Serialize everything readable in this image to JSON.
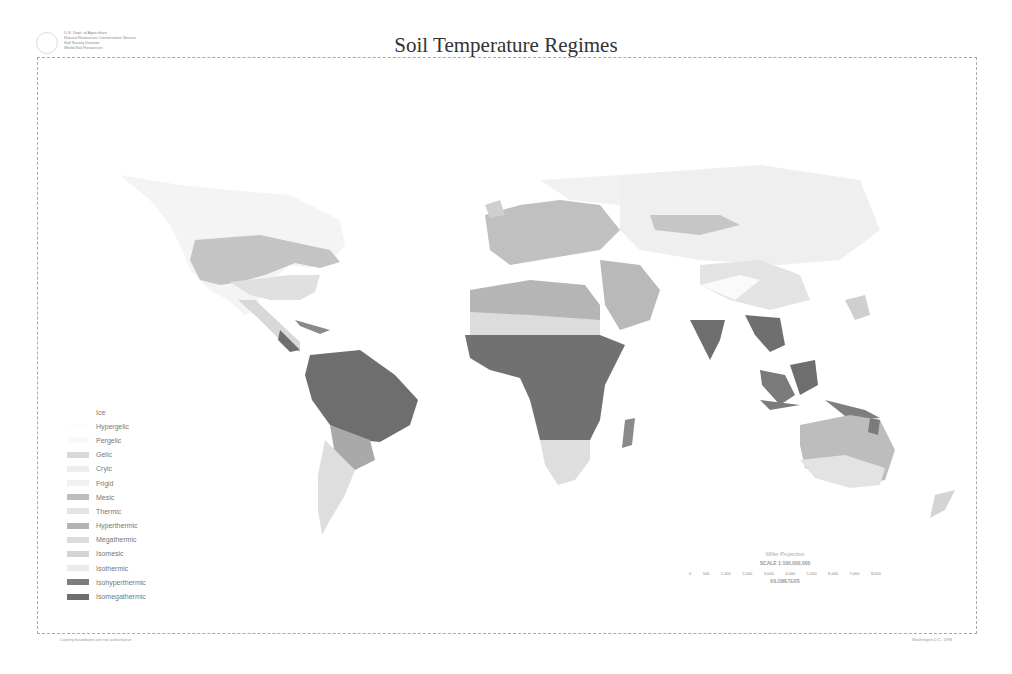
{
  "header": {
    "agency_lines": [
      "U.S. Dept. of Agriculture",
      "Natural Resources Conservation Service",
      "Soil Survey Division",
      "World Soil Resources"
    ],
    "title": "Soil Temperature Regimes"
  },
  "legend": {
    "items": [
      {
        "label": "Ice",
        "color": "#ffffff"
      },
      {
        "label": "Hypergelic",
        "color": "#fdfdfd"
      },
      {
        "label": "Pergelic",
        "color": "#f8f8f8"
      },
      {
        "label": "Gelic",
        "color": "#d9d9d9"
      },
      {
        "label": "Cryic",
        "color": "#eeeeee"
      },
      {
        "label": "Frigid",
        "color": "#f1f1f1"
      },
      {
        "label": "Mesic",
        "color": "#bdbdbd"
      },
      {
        "label": "Thermic",
        "color": "#e3e3e3"
      },
      {
        "label": "Hyperthermic",
        "color": "#b3b3b3"
      },
      {
        "label": "Megathermic",
        "color": "#dcdcdc"
      },
      {
        "label": "Isomesic",
        "color": "#d4d4d4"
      },
      {
        "label": "Isothermic",
        "color": "#ebebeb"
      },
      {
        "label": "Isohyperthermic",
        "color": "#7d7d7d"
      },
      {
        "label": "Isomegathermic",
        "color": "#6e6e6e"
      }
    ]
  },
  "scale": {
    "projection": "Miller Projection",
    "ratio": "SCALE 1:100,000,000",
    "ticks": [
      "0",
      "500",
      "1,000",
      "2,000",
      "3,000",
      "4,000",
      "5,000",
      "6,000",
      "7,000",
      "8,000"
    ],
    "unit": "KILOMETERS"
  },
  "footer": {
    "left": "Country boundaries are not authoritative",
    "right": "Washington D.C. 1998"
  }
}
